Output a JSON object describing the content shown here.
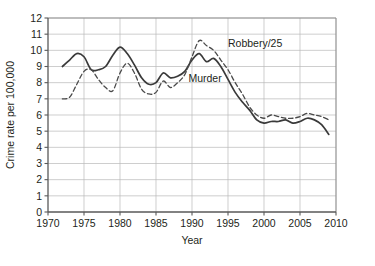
{
  "chart_data": {
    "type": "line",
    "title": "",
    "xlabel": "Year",
    "ylabel": "Crime rate per 100,000",
    "xlim": [
      1970,
      2010
    ],
    "ylim": [
      0,
      12
    ],
    "xticks": [
      1970,
      1975,
      1980,
      1985,
      1990,
      1995,
      2000,
      2005,
      2010
    ],
    "yticks": [
      0,
      1,
      2,
      3,
      4,
      5,
      6,
      7,
      8,
      9,
      10,
      11,
      12
    ],
    "grid": true,
    "legend_position": "inline-annotations",
    "x": [
      1972,
      1973,
      1974,
      1975,
      1976,
      1977,
      1978,
      1979,
      1980,
      1981,
      1982,
      1983,
      1984,
      1985,
      1986,
      1987,
      1988,
      1989,
      1990,
      1991,
      1992,
      1993,
      1994,
      1995,
      1996,
      1997,
      1998,
      1999,
      2000,
      2001,
      2002,
      2003,
      2004,
      2005,
      2006,
      2007,
      2008,
      2009
    ],
    "series": [
      {
        "name": "Murder",
        "style": "solid",
        "color": "#3a3a3a",
        "values": [
          9.0,
          9.4,
          9.8,
          9.6,
          8.8,
          8.8,
          9.0,
          9.7,
          10.2,
          9.8,
          9.1,
          8.3,
          7.9,
          8.0,
          8.6,
          8.3,
          8.4,
          8.7,
          9.4,
          9.8,
          9.3,
          9.5,
          9.0,
          8.2,
          7.4,
          6.8,
          6.3,
          5.7,
          5.5,
          5.6,
          5.6,
          5.7,
          5.5,
          5.6,
          5.8,
          5.7,
          5.4,
          4.8
        ]
      },
      {
        "name": "Robbery/25",
        "style": "dashed",
        "color": "#4a4a4a",
        "values": [
          7.0,
          7.1,
          7.9,
          8.7,
          8.8,
          8.2,
          7.7,
          7.5,
          8.6,
          9.2,
          8.6,
          7.6,
          7.3,
          7.4,
          8.1,
          7.7,
          8.0,
          8.5,
          9.6,
          10.6,
          10.3,
          10.0,
          9.4,
          8.8,
          8.0,
          7.3,
          6.5,
          6.0,
          5.8,
          6.0,
          5.9,
          5.8,
          5.8,
          5.9,
          6.1,
          6.0,
          5.9,
          5.7
        ]
      }
    ],
    "annotations": [
      {
        "text": "Robbery/25",
        "x": 1995.0,
        "y": 10.2
      },
      {
        "text": "Murder",
        "x": 1989.5,
        "y": 8.05
      }
    ],
    "colors": {
      "grid": "#b9b9b9",
      "axis": "#595959",
      "text": "#231f20",
      "background": "#ffffff"
    }
  }
}
